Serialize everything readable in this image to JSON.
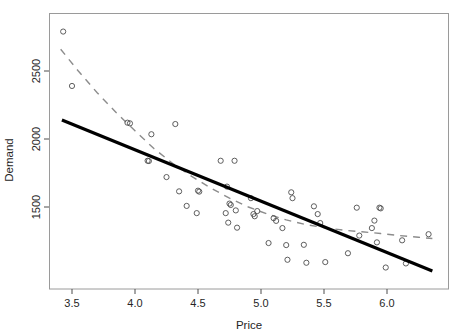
{
  "chart_data": {
    "type": "scatter",
    "title": "",
    "xlabel": "Price",
    "ylabel": "Demand",
    "xlim": [
      3.34,
      6.37
    ],
    "ylim": [
      1020,
      2830
    ],
    "xticks": [
      3.5,
      4.0,
      4.5,
      5.0,
      5.5,
      6.0
    ],
    "xtick_labels": [
      "3.5",
      "4.0",
      "4.5",
      "5.0",
      "5.5",
      "6.0"
    ],
    "yticks": [
      1500,
      2000,
      2500
    ],
    "ytick_labels": [
      "1500",
      "2000",
      "2500"
    ],
    "grid": false,
    "legend": null,
    "series": [
      {
        "name": "observations",
        "type": "scatter",
        "marker": "open-circle",
        "color": "#4d4d4d",
        "points": [
          [
            3.43,
            2790
          ],
          [
            3.5,
            2390
          ],
          [
            3.94,
            2120
          ],
          [
            3.96,
            2115
          ],
          [
            4.13,
            2035
          ],
          [
            4.32,
            2110
          ],
          [
            4.1,
            1840
          ],
          [
            4.11,
            1838
          ],
          [
            4.25,
            1720
          ],
          [
            4.35,
            1615
          ],
          [
            4.41,
            1508
          ],
          [
            4.49,
            1455
          ],
          [
            4.5,
            1620
          ],
          [
            4.51,
            1613
          ],
          [
            4.68,
            1840
          ],
          [
            4.72,
            1455
          ],
          [
            4.74,
            1385
          ],
          [
            4.75,
            1525
          ],
          [
            4.76,
            1515
          ],
          [
            4.79,
            1840
          ],
          [
            4.73,
            1650
          ],
          [
            4.8,
            1475
          ],
          [
            4.81,
            1348
          ],
          [
            4.92,
            1565
          ],
          [
            4.94,
            1448
          ],
          [
            4.95,
            1432
          ],
          [
            4.97,
            1470
          ],
          [
            5.06,
            1235
          ],
          [
            5.1,
            1418
          ],
          [
            5.12,
            1398
          ],
          [
            5.17,
            1345
          ],
          [
            5.2,
            1220
          ],
          [
            5.21,
            1112
          ],
          [
            5.24,
            1608
          ],
          [
            5.25,
            1565
          ],
          [
            5.34,
            1222
          ],
          [
            5.36,
            1090
          ],
          [
            5.42,
            1505
          ],
          [
            5.45,
            1448
          ],
          [
            5.47,
            1382
          ],
          [
            5.51,
            1095
          ],
          [
            5.69,
            1160
          ],
          [
            5.76,
            1495
          ],
          [
            5.78,
            1290
          ],
          [
            5.88,
            1345
          ],
          [
            5.9,
            1400
          ],
          [
            5.92,
            1240
          ],
          [
            5.94,
            1495
          ],
          [
            5.95,
            1490
          ],
          [
            5.99,
            1055
          ],
          [
            6.12,
            1255
          ],
          [
            6.15,
            1085
          ],
          [
            6.33,
            1300
          ]
        ]
      },
      {
        "name": "ols-fit",
        "type": "line",
        "style": "solid",
        "width": 3.2,
        "color": "#000000",
        "points": [
          [
            3.42,
            2140
          ],
          [
            6.36,
            1030
          ]
        ]
      },
      {
        "name": "loess-smooth",
        "type": "line",
        "style": "dashed",
        "width": 1.4,
        "color": "#8c8c8c",
        "points": [
          [
            3.41,
            2660
          ],
          [
            3.55,
            2500
          ],
          [
            3.7,
            2340
          ],
          [
            3.85,
            2195
          ],
          [
            4.0,
            2060
          ],
          [
            4.15,
            1930
          ],
          [
            4.3,
            1820
          ],
          [
            4.45,
            1725
          ],
          [
            4.6,
            1640
          ],
          [
            4.75,
            1565
          ],
          [
            4.9,
            1500
          ],
          [
            5.05,
            1448
          ],
          [
            5.2,
            1405
          ],
          [
            5.35,
            1372
          ],
          [
            5.5,
            1348
          ],
          [
            5.65,
            1330
          ],
          [
            5.8,
            1318
          ],
          [
            5.95,
            1305
          ],
          [
            6.1,
            1290
          ],
          [
            6.25,
            1278
          ],
          [
            6.36,
            1268
          ]
        ]
      }
    ]
  },
  "axis": {
    "x_label": "Price",
    "y_label": "Demand"
  }
}
